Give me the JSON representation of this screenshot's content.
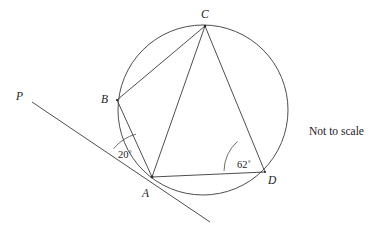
{
  "figure": {
    "type": "circle-geometry-diagram",
    "note": "Not to scale",
    "points": [
      {
        "id": "P",
        "label": "P",
        "label_x": 16,
        "label_y": 91,
        "x": 32,
        "y": 102,
        "on_circle": false
      },
      {
        "id": "B",
        "label": "B",
        "label_x": 101,
        "label_y": 94,
        "x": 117,
        "y": 100,
        "on_circle": true
      },
      {
        "id": "C",
        "label": "C",
        "label_x": 201,
        "label_y": 9,
        "x": 205,
        "y": 26,
        "on_circle": true
      },
      {
        "id": "A",
        "label": "A",
        "label_x": 142,
        "label_y": 188,
        "x": 152,
        "y": 177,
        "on_circle": true
      },
      {
        "id": "D",
        "label": "D",
        "label_x": 268,
        "label_y": 175,
        "x": 265,
        "y": 172,
        "on_circle": true
      }
    ],
    "circle": {
      "cx": 203,
      "cy": 110,
      "r": 85
    },
    "segments": [
      {
        "name": "BC",
        "from": "B",
        "to": "C"
      },
      {
        "name": "CA",
        "from": "C",
        "to": "A"
      },
      {
        "name": "CD",
        "from": "C",
        "to": "D"
      },
      {
        "name": "AB",
        "from": "A",
        "to": "B"
      },
      {
        "name": "AD",
        "from": "A",
        "to": "D"
      }
    ],
    "tangent": {
      "name": "tangent-line-PA",
      "x1": 32,
      "y1": 102,
      "x2": 210,
      "y2": 222,
      "through": "A",
      "ray_end_label": "P"
    },
    "angles": [
      {
        "id": "angle-at-A",
        "value": "20",
        "label": "20˚",
        "vertex": "A",
        "between": [
          "tangent-toward-P",
          "AB"
        ],
        "label_x": 118,
        "label_y": 150
      },
      {
        "id": "angle-at-D",
        "value": "62",
        "label": "62˚",
        "vertex": "D",
        "between": [
          "DA",
          "DC"
        ],
        "label_x": 237,
        "label_y": 160
      }
    ],
    "colors": {
      "stroke": "#3a3a3a",
      "text": "#1c1c1c",
      "background": "#ffffff"
    }
  }
}
